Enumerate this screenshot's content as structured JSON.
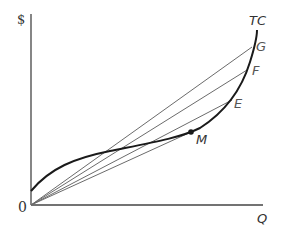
{
  "axes": {
    "y_label": "$",
    "x_label": "Q",
    "origin_label": "0"
  },
  "curves": {
    "total_cost_label": "TC",
    "point_m_label": "M",
    "point_e_label": "E",
    "point_f_label": "F",
    "point_g_label": "G"
  },
  "colors": {
    "curve": "#1a1a1a",
    "rays": "#6b6b6b",
    "axes": "#444444"
  }
}
